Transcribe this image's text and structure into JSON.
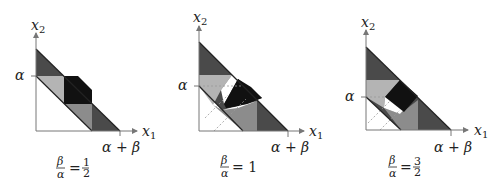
{
  "figure": {
    "panels": [
      {
        "id": "panel-1",
        "ratio_label": {
          "lhs_num": "β",
          "lhs_den": "α",
          "eq": "=",
          "rhs_num": "1",
          "rhs_den": "2"
        },
        "axis_x_label": "x",
        "axis_x_sub": "1",
        "axis_y_label": "x",
        "axis_y_sub": "2",
        "y_tick_label": "α",
        "x_tick_label": "α + β"
      },
      {
        "id": "panel-2",
        "ratio_label": {
          "lhs_num": "β",
          "lhs_den": "α",
          "eq": "= 1"
        },
        "axis_x_label": "x",
        "axis_x_sub": "1",
        "axis_y_label": "x",
        "axis_y_sub": "2",
        "y_tick_label": "α",
        "x_tick_label": "α + β"
      },
      {
        "id": "panel-3",
        "ratio_label": {
          "lhs_num": "β",
          "lhs_den": "α",
          "eq": "=",
          "rhs_num": "3",
          "rhs_den": "2"
        },
        "axis_x_label": "x",
        "axis_x_sub": "1",
        "axis_y_label": "x",
        "axis_y_sub": "2",
        "y_tick_label": "α",
        "x_tick_label": "α + β"
      }
    ],
    "colors": {
      "dark_gray": "#4a4a4a",
      "mid_gray": "#8c8c8c",
      "light_gray": "#b4b4b4",
      "black": "#111111",
      "axis": "#777777"
    }
  }
}
